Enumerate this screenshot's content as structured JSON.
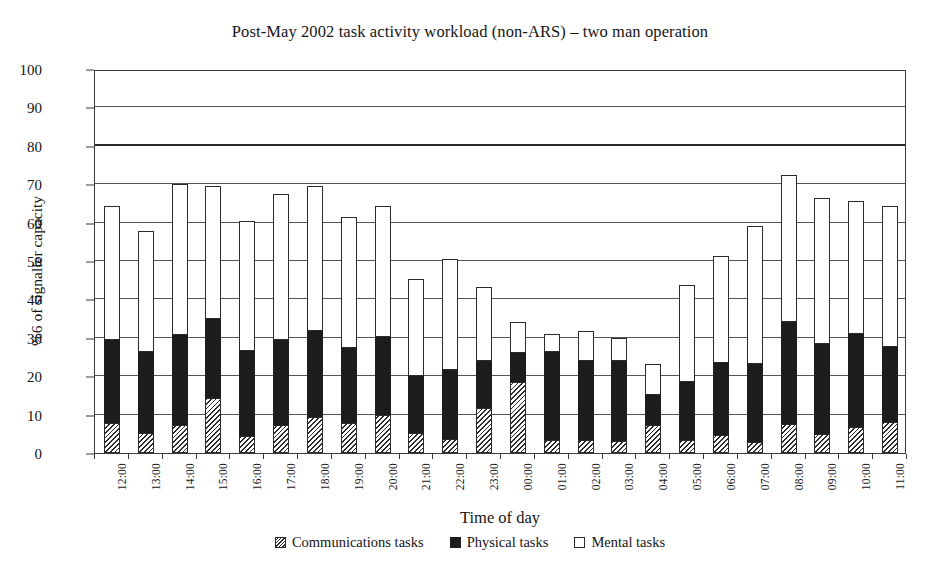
{
  "chart_data": {
    "type": "bar",
    "stacked": true,
    "title": "Post-May 2002 task activity workload (non-ARS) – two man operation",
    "subtitle": "",
    "xlabel": "Time of day",
    "ylabel": "%6 of signaller capacity",
    "ylim": [
      0,
      100
    ],
    "ytick_step": 10,
    "yticks": [
      0,
      10,
      20,
      30,
      40,
      50,
      60,
      70,
      80,
      90,
      100
    ],
    "grid": true,
    "bold_gridlines": [
      80
    ],
    "legend_position": "bottom",
    "categories": [
      "12:00",
      "13:00",
      "14:00",
      "15:00",
      "16:00",
      "17:00",
      "18:00",
      "19:00",
      "20:00",
      "21:00",
      "22:00",
      "23:00",
      "00:00",
      "01:00",
      "02:00",
      "03:00",
      "04:00",
      "05:00",
      "06:00",
      "07:00",
      "08:00",
      "09:00",
      "10:00",
      "11:00"
    ],
    "series": [
      {
        "name": "Communications tasks",
        "pattern": "hatched",
        "color": "#ffffff",
        "values": [
          7.8,
          5.2,
          7.2,
          14.3,
          4.5,
          7.3,
          9.4,
          7.7,
          9.9,
          5.3,
          3.6,
          11.8,
          18.6,
          3.4,
          3.3,
          3.2,
          7.4,
          3.4,
          4.8,
          2.9,
          7.5,
          5.0,
          6.8,
          8.0
        ]
      },
      {
        "name": "Physical tasks",
        "pattern": "solid",
        "color": "#1c1c1c",
        "values": [
          21.7,
          21.1,
          23.6,
          20.7,
          22.0,
          22.2,
          22.4,
          19.6,
          20.4,
          14.7,
          17.9,
          12.2,
          7.4,
          23.0,
          20.6,
          20.7,
          7.8,
          15.2,
          18.7,
          20.4,
          26.5,
          23.4,
          24.3,
          19.5
        ]
      },
      {
        "name": "Mental tasks",
        "pattern": "empty",
        "color": "#ffffff",
        "values": [
          34.8,
          31.5,
          39.2,
          34.6,
          34.0,
          38.0,
          37.7,
          34.2,
          34.1,
          25.4,
          29.0,
          19.3,
          8.2,
          4.5,
          7.9,
          6.0,
          8.0,
          25.2,
          27.8,
          35.8,
          38.3,
          38.1,
          34.4,
          36.8
        ]
      }
    ],
    "totals": [
      64.3,
      57.8,
      70.0,
      69.6,
      60.5,
      67.5,
      69.5,
      61.5,
      64.4,
      45.4,
      50.5,
      43.3,
      34.2,
      30.9,
      31.8,
      29.9,
      23.2,
      43.8,
      51.3,
      59.1,
      72.3,
      66.5,
      65.5,
      64.3
    ]
  },
  "legend": {
    "items": [
      {
        "label": "Communications tasks",
        "swatch": "hatched-swatch"
      },
      {
        "label": "Physical tasks",
        "swatch": "solid-black-swatch"
      },
      {
        "label": "Mental tasks",
        "swatch": "empty-white-swatch"
      }
    ]
  }
}
